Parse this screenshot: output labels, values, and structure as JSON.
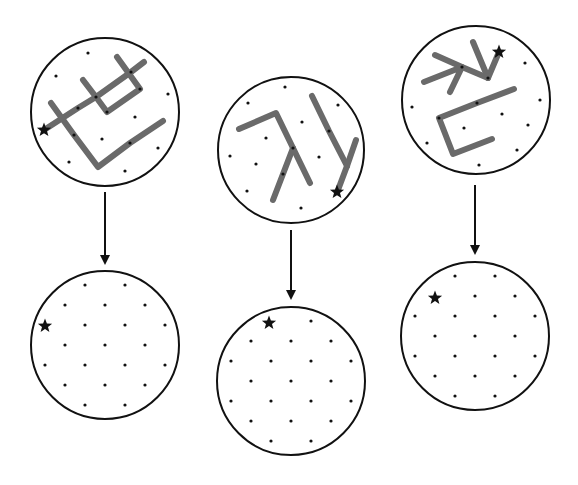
{
  "diagram": {
    "colors": {
      "outline": "#111111",
      "stroke_path": "#6a6a6a",
      "background": "#ffffff"
    },
    "star_glyph": "★",
    "panels": [
      {
        "id": "panel-1",
        "top": {
          "center": [
            105,
            112
          ],
          "radius": 74,
          "star": [
            44,
            130
          ],
          "dots": [
            [
              88,
              53
            ],
            [
              56,
              76
            ],
            [
              168,
              94
            ],
            [
              135,
              117
            ],
            [
              102,
              139
            ],
            [
              158,
              148
            ],
            [
              69,
              162
            ],
            [
              125,
              171
            ],
            [
              96,
              97
            ],
            [
              78,
              108
            ],
            [
              131,
              72
            ],
            [
              74,
              135
            ],
            [
              130,
              143
            ],
            [
              140,
              89
            ],
            [
              107,
              112
            ]
          ],
          "paths": [
            [
              [
                44,
                130
              ],
              [
                78,
                108
              ],
              [
                96,
                97
              ],
              [
                131,
                72
              ],
              [
                144,
                62
              ]
            ],
            [
              [
                83,
                80
              ],
              [
                96,
                97
              ],
              [
                107,
                112
              ],
              [
                140,
                89
              ],
              [
                117,
                57
              ]
            ],
            [
              [
                51,
                103
              ],
              [
                74,
                135
              ],
              [
                98,
                167
              ],
              [
                130,
                143
              ],
              [
                163,
                121
              ]
            ]
          ]
        },
        "arrow": {
          "x": 105,
          "y1": 192,
          "y2": 265
        },
        "bottom": {
          "center": [
            105,
            345
          ],
          "radius": 74,
          "star": [
            45,
            326
          ]
        }
      },
      {
        "id": "panel-2",
        "top": {
          "center": [
            291,
            150
          ],
          "radius": 73,
          "star": [
            337,
            192
          ],
          "dots": [
            [
              285,
              87
            ],
            [
              248,
              103
            ],
            [
              338,
              105
            ],
            [
              302,
              122
            ],
            [
              266,
              138
            ],
            [
              230,
              156
            ],
            [
              319,
              157
            ],
            [
              256,
              164
            ],
            [
              247,
              191
            ],
            [
              301,
              208
            ],
            [
              293,
              148
            ],
            [
              283,
              174
            ],
            [
              329,
              131
            ]
          ],
          "paths": [
            [
              [
                239,
                129
              ],
              [
                276,
                113
              ],
              [
                293,
                148
              ],
              [
                310,
                183
              ]
            ],
            [
              [
                293,
                148
              ],
              [
                283,
                174
              ],
              [
                273,
                200
              ]
            ],
            [
              [
                312,
                96
              ],
              [
                329,
                131
              ],
              [
                347,
                166
              ]
            ],
            [
              [
                356,
                140
              ],
              [
                347,
                166
              ],
              [
                338,
                190
              ]
            ]
          ]
        },
        "arrow": {
          "x": 291,
          "y1": 230,
          "y2": 300
        },
        "bottom": {
          "center": [
            291,
            381
          ],
          "radius": 74,
          "star": [
            269,
            323
          ]
        }
      },
      {
        "id": "panel-3",
        "top": {
          "center": [
            476,
            100
          ],
          "radius": 74,
          "star": [
            499,
            52
          ],
          "dots": [
            [
              525,
              63
            ],
            [
              540,
              100
            ],
            [
              412,
              107
            ],
            [
              502,
              114
            ],
            [
              528,
              125
            ],
            [
              464,
              128
            ],
            [
              427,
              143
            ],
            [
              517,
              150
            ],
            [
              479,
              165
            ],
            [
              462,
              67
            ],
            [
              488,
              78
            ],
            [
              477,
              103
            ],
            [
              439,
              118
            ]
          ],
          "paths": [
            [
              [
                435,
                55
              ],
              [
                462,
                67
              ],
              [
                488,
                78
              ]
            ],
            [
              [
                473,
                42
              ],
              [
                488,
                78
              ],
              [
                499,
                52
              ]
            ],
            [
              [
                424,
                82
              ],
              [
                462,
                67
              ],
              [
                450,
                92
              ]
            ],
            [
              [
                514,
                89
              ],
              [
                477,
                103
              ],
              [
                439,
                118
              ],
              [
                453,
                154
              ],
              [
                492,
                139
              ]
            ]
          ]
        },
        "arrow": {
          "x": 475,
          "y1": 185,
          "y2": 255
        },
        "bottom": {
          "center": [
            475,
            336
          ],
          "radius": 74,
          "star": [
            435,
            298
          ]
        }
      }
    ]
  }
}
